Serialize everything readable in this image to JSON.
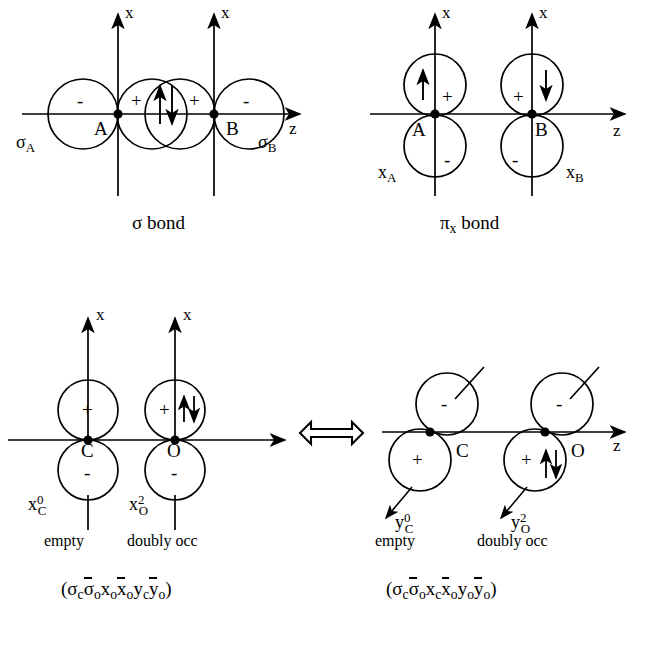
{
  "figure": {
    "stroke_color": "#000000",
    "background_color": "#ffffff"
  },
  "panels": [
    {
      "id": "sigma-bond",
      "caption": "σ bond",
      "axes": {
        "vertical": "x",
        "horizontal": "z"
      },
      "atoms": [
        {
          "name": "A",
          "label": "A"
        },
        {
          "name": "B",
          "label": "B"
        }
      ],
      "orbital_labels": [
        {
          "name": "sigma-a",
          "base": "σ",
          "sub": "A"
        },
        {
          "name": "sigma-b",
          "base": "σ",
          "sub": "B"
        }
      ],
      "lobe_signs": [
        "-",
        "+",
        "+",
        "-"
      ],
      "spin": "paired",
      "spin_glyphs": {
        "up": "↑",
        "down": "↓"
      }
    },
    {
      "id": "pi-x-bond",
      "caption_base": "π",
      "caption_sub": "x",
      "caption_rest": " bond",
      "axes": {
        "vertical": "x",
        "horizontal": "z"
      },
      "atoms": [
        {
          "name": "A",
          "label": "A"
        },
        {
          "name": "B",
          "label": "B"
        }
      ],
      "orbital_labels": [
        {
          "name": "x-a",
          "base": "x",
          "sub": "A"
        },
        {
          "name": "x-b",
          "base": "x",
          "sub": "B"
        }
      ],
      "lobe_signs_top": [
        "+",
        "+"
      ],
      "lobe_signs_bottom": [
        "-",
        "-"
      ],
      "spin_left": "↑",
      "spin_right": "↓"
    },
    {
      "id": "co-x-structure",
      "axes": {
        "vertical": "x",
        "horizontal": "z"
      },
      "atoms": [
        {
          "name": "C",
          "label": "C"
        },
        {
          "name": "O",
          "label": "O"
        }
      ],
      "orbitals": [
        {
          "name": "x-c",
          "base": "x",
          "sup": "0",
          "sub": "C",
          "occupancy": "empty",
          "top_sign": "+",
          "bottom_sign": "-",
          "spin": "none"
        },
        {
          "name": "x-o",
          "base": "x",
          "sup": "2",
          "sub": "O",
          "occupancy": "doubly occ",
          "top_sign": "+",
          "bottom_sign": "-",
          "spin": "paired"
        }
      ],
      "configuration": {
        "open": "(",
        "terms": [
          {
            "base": "σ",
            "sub": "c",
            "bar": false
          },
          {
            "base": "σ",
            "sub": "o",
            "bar": true
          },
          {
            "base": "x",
            "sub": "o",
            "bar": false
          },
          {
            "base": "x",
            "sub": "o",
            "bar": true
          },
          {
            "base": "y",
            "sub": "c",
            "bar": false
          },
          {
            "base": "y",
            "sub": "o",
            "bar": true
          }
        ],
        "close": ")"
      }
    },
    {
      "id": "co-y-structure",
      "axes": {
        "horizontal": "z"
      },
      "atoms": [
        {
          "name": "C",
          "label": "C"
        },
        {
          "name": "O",
          "label": "O"
        }
      ],
      "orbitals": [
        {
          "name": "y-c",
          "base": "y",
          "sup": "0",
          "sub": "C",
          "occupancy": "empty",
          "top_sign": "-",
          "bottom_sign": "+",
          "spin": "none"
        },
        {
          "name": "y-o",
          "base": "y",
          "sup": "2",
          "sub": "O",
          "occupancy": "doubly occ",
          "top_sign": "-",
          "bottom_sign": "+",
          "spin": "paired"
        }
      ],
      "configuration": {
        "open": "(",
        "terms": [
          {
            "base": "σ",
            "sub": "c",
            "bar": false
          },
          {
            "base": "σ",
            "sub": "o",
            "bar": true
          },
          {
            "base": "x",
            "sub": "c",
            "bar": false
          },
          {
            "base": "x",
            "sub": "o",
            "bar": true
          },
          {
            "base": "y",
            "sub": "o",
            "bar": false
          },
          {
            "base": "y",
            "sub": "o",
            "bar": true
          }
        ],
        "close": ")"
      }
    }
  ],
  "resonance_arrow": {
    "name": "resonance-double-arrow",
    "glyph": "⟺",
    "direction": "both"
  }
}
